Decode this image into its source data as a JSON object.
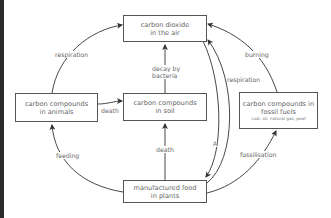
{
  "diagram": {
    "nodes": {
      "co2": {
        "line1": "carbon dioxide",
        "line2": "in the air"
      },
      "animals": {
        "line1": "carbon compounds",
        "line2": "in animals"
      },
      "soil": {
        "line1": "carbon compounds",
        "line2": "in soil"
      },
      "fossil": {
        "line1": "carbon compounds in",
        "line2": "fossil fuels",
        "sub": "coal, oil, natural gas, peat"
      },
      "plants": {
        "line1": "manufactured food",
        "line2": "in plants"
      }
    },
    "edges": {
      "animals_resp": "respiration",
      "fossil_burn": "burning",
      "plants_resp": "respiration",
      "decay1": "decay by",
      "decay2": "bacteria",
      "animals_death": "death",
      "plants_death": "death",
      "feeding": "feeding",
      "photosynthesis": "A",
      "fossilisation": "fossilisation"
    },
    "line_color": "#333333",
    "text_color": "#666666"
  }
}
